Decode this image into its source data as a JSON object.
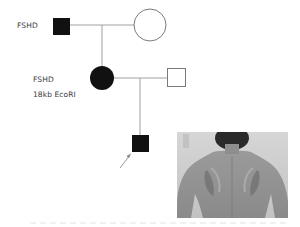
{
  "figure": {
    "type": "pedigree",
    "labels": {
      "father": "FSHD",
      "daughter_line1": "FSHD",
      "daughter_line2": "18kb  EcoRI"
    },
    "individuals": [
      {
        "id": "I-1",
        "sex": "male",
        "affected": true,
        "label": "FSHD"
      },
      {
        "id": "I-2",
        "sex": "female",
        "affected": false
      },
      {
        "id": "II-1",
        "sex": "female",
        "affected": true,
        "label": "FSHD 18kb EcoRI"
      },
      {
        "id": "II-2",
        "sex": "male",
        "affected": false
      },
      {
        "id": "III-1",
        "sex": "male",
        "affected": true,
        "proband": true
      }
    ],
    "photo": {
      "description": "back of patient showing scapular winging"
    },
    "colors": {
      "affected": "#111111",
      "line": "#9a9a9a",
      "unaffected_fill": "#ffffff"
    }
  }
}
